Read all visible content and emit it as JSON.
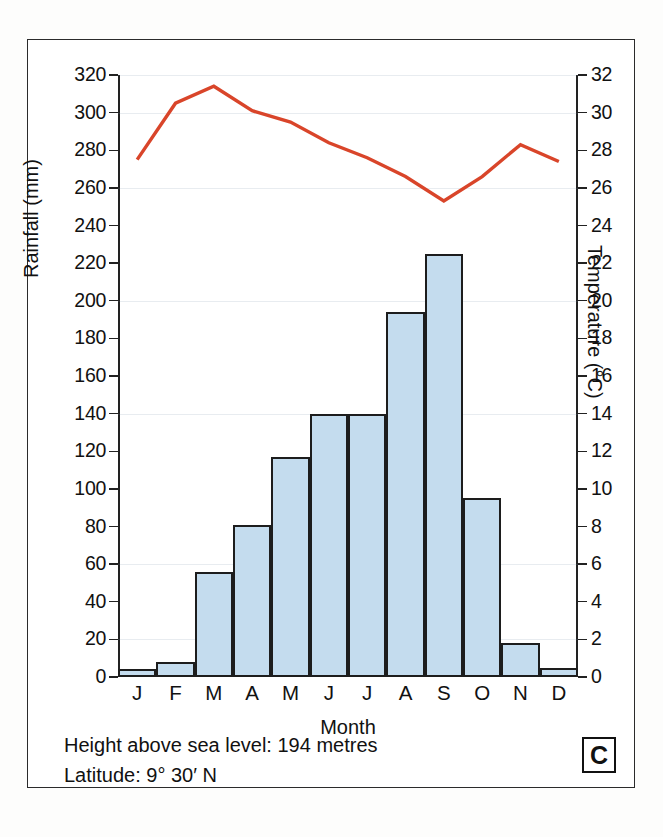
{
  "panel": {
    "letter": "C"
  },
  "footnotes": [
    "Height above sea level: 194 metres",
    "Latitude: 9° 30′ N"
  ],
  "colors": {
    "bar_fill": "#c4dcee",
    "bar_stroke": "#1d1d1d",
    "temperature_line": "#d9452a",
    "axis": "#222222",
    "frame": "#2b2b2b"
  },
  "chart_data": {
    "type": "bar",
    "title": "",
    "xlabel": "Month",
    "ylabel": "Rainfall (mm)",
    "y2label": "Temperature (°C)",
    "categories": [
      "J",
      "F",
      "M",
      "A",
      "M",
      "J",
      "J",
      "A",
      "S",
      "O",
      "N",
      "D"
    ],
    "month_names": [
      "January",
      "February",
      "March",
      "April",
      "May",
      "June",
      "July",
      "August",
      "September",
      "October",
      "November",
      "December"
    ],
    "values": [
      4,
      8,
      56,
      81,
      117,
      140,
      140,
      194,
      225,
      95,
      18,
      5
    ],
    "ylim": [
      0,
      320
    ],
    "ytick_step": 20,
    "yticks": [
      0,
      20,
      40,
      60,
      80,
      100,
      120,
      140,
      160,
      180,
      200,
      220,
      240,
      260,
      280,
      300,
      320
    ],
    "y2lim": [
      0,
      32
    ],
    "y2tick_step": 2,
    "y2ticks": [
      0,
      2,
      4,
      6,
      8,
      10,
      12,
      14,
      16,
      18,
      20,
      22,
      24,
      26,
      28,
      30,
      32
    ],
    "grid": false,
    "legend": "none",
    "series": [
      {
        "name": "Rainfall (mm)",
        "type": "bar",
        "axis": "left",
        "values": [
          4,
          8,
          56,
          81,
          117,
          140,
          140,
          194,
          225,
          95,
          18,
          5
        ]
      },
      {
        "name": "Temperature (°C)",
        "type": "line",
        "axis": "right",
        "values": [
          27.5,
          30.5,
          31.4,
          30.1,
          29.5,
          28.4,
          27.6,
          26.6,
          25.3,
          26.6,
          28.3,
          27.4
        ]
      }
    ]
  }
}
